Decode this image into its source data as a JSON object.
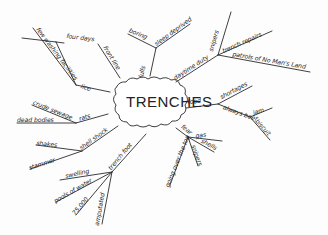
{
  "diagram": {
    "type": "mind-map",
    "style": "hand-drawn",
    "center": {
      "label": "TRENCHES"
    },
    "branches": [
      {
        "label": "lice",
        "children": [
          {
            "label": "few washing facilities"
          },
          {
            "label": "four days"
          }
        ]
      },
      {
        "label": "front line"
      },
      {
        "label": "lulls",
        "children": [
          {
            "label": "boring"
          },
          {
            "label": "sleep deprived"
          }
        ]
      },
      {
        "label": "daytime duty",
        "children": [
          {
            "label": "snipers"
          },
          {
            "label": "trench repairs"
          },
          {
            "label": "patrols of No Man's Land"
          }
        ]
      },
      {
        "label": "food",
        "children": [
          {
            "label": "shortages"
          },
          {
            "label": "always beef",
            "children": [
              {
                "label": "jam"
              },
              {
                "label": "biscuit"
              }
            ]
          }
        ]
      },
      {
        "label": "fear",
        "children": [
          {
            "label": "gas"
          },
          {
            "label": "shells"
          },
          {
            "label": "snipers"
          },
          {
            "label": "going over the top"
          }
        ]
      },
      {
        "label": "trench foot",
        "children": [
          {
            "label": "swelling"
          },
          {
            "label": "pools of water"
          },
          {
            "label": "75,000"
          },
          {
            "label": "amputated"
          }
        ]
      },
      {
        "label": "shell shock",
        "children": [
          {
            "label": "shakes"
          },
          {
            "label": "stammer"
          }
        ]
      },
      {
        "label": "rats",
        "children": [
          {
            "label": "crude sewage"
          },
          {
            "label": "dead bodies"
          }
        ]
      }
    ],
    "labels": {
      "center": "TRENCHES",
      "lice": "lice",
      "few_washing": "few washing facilities",
      "four_days": "four days",
      "front_line": "front line",
      "lulls": "lulls",
      "boring": "boring",
      "sleep_deprived": "sleep deprived",
      "daytime_duty": "daytime duty",
      "snipers_top": "snipers",
      "trench_repairs": "trench repairs",
      "patrols": "patrols of No Man's Land",
      "food": "food",
      "shortages": "shortages",
      "always_beef": "always beef",
      "jam": "jam",
      "biscuit": "biscuit",
      "fear": "fear",
      "gas": "gas",
      "shells": "shells",
      "snipers_fear": "snipers",
      "going_over": "going over the top",
      "trench_foot": "trench foot",
      "swelling": "swelling",
      "pools": "pools of water",
      "count": "75,000",
      "amputated": "amputated",
      "shell_shock": "shell shock",
      "shakes": "shakes",
      "stammer": "stammer",
      "rats": "rats",
      "crude_sewage": "crude sewage",
      "dead_bodies": "dead bodies"
    }
  }
}
